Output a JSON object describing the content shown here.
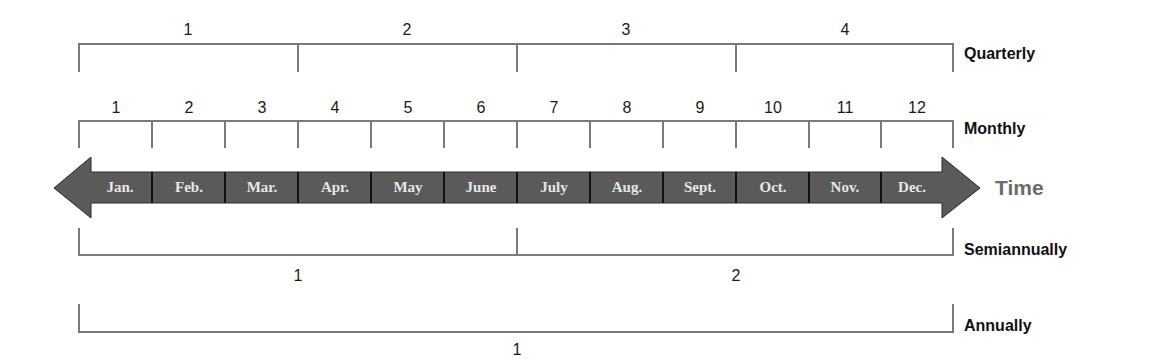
{
  "diagram": {
    "type": "timeline",
    "axis_label": "Time",
    "colors": {
      "bracket": "#7a7a7a",
      "bar_fill": "#5a5a5a",
      "bar_divider": "#111111",
      "month_text": "#e6e6e6",
      "time_text": "#6b6b6b"
    },
    "months": [
      {
        "num": "1",
        "label": "Jan."
      },
      {
        "num": "2",
        "label": "Feb."
      },
      {
        "num": "3",
        "label": "Mar."
      },
      {
        "num": "4",
        "label": "Apr."
      },
      {
        "num": "5",
        "label": "May"
      },
      {
        "num": "6",
        "label": "June"
      },
      {
        "num": "7",
        "label": "July"
      },
      {
        "num": "8",
        "label": "Aug."
      },
      {
        "num": "9",
        "label": "Sept."
      },
      {
        "num": "10",
        "label": "Oct."
      },
      {
        "num": "11",
        "label": "Nov."
      },
      {
        "num": "12",
        "label": "Dec."
      }
    ],
    "quarterly": {
      "label": "Quarterly",
      "periods": [
        "1",
        "2",
        "3",
        "4"
      ]
    },
    "monthly": {
      "label": "Monthly"
    },
    "semiannually": {
      "label": "Semiannually",
      "periods": [
        "1",
        "2"
      ]
    },
    "annually": {
      "label": "Annually",
      "periods": [
        "1"
      ]
    }
  }
}
